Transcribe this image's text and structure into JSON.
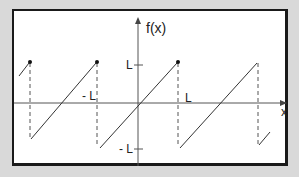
{
  "diagram": {
    "axis_labels": {
      "y": "f(x)",
      "x": "x"
    },
    "tick_labels": {
      "L_y": "L",
      "neg_L_y": "- L",
      "L_x": "L",
      "neg_L_x": "- L"
    },
    "colors": {
      "line": "#333333",
      "frame": "#1a1a1a",
      "background": "#d9d9d9",
      "panel": "#ffffff"
    }
  }
}
